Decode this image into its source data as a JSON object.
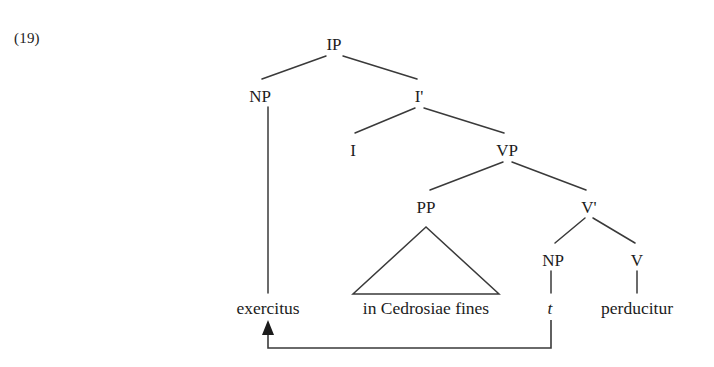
{
  "example": {
    "number": "(19)"
  },
  "tree": {
    "nodes": [
      {
        "id": "IP",
        "label": "IP",
        "x": 334,
        "y": 36
      },
      {
        "id": "NP1",
        "label": "NP",
        "x": 260,
        "y": 88
      },
      {
        "id": "Ibar",
        "label": "I'",
        "x": 419,
        "y": 88
      },
      {
        "id": "I",
        "label": "I",
        "x": 353,
        "y": 142
      },
      {
        "id": "VP",
        "label": "VP",
        "x": 507,
        "y": 142
      },
      {
        "id": "PP",
        "label": "PP",
        "x": 426,
        "y": 199
      },
      {
        "id": "Vbar",
        "label": "V'",
        "x": 589,
        "y": 199
      },
      {
        "id": "NP2",
        "label": "NP",
        "x": 553,
        "y": 252
      },
      {
        "id": "V",
        "label": "V",
        "x": 637,
        "y": 252
      }
    ],
    "leaves": [
      {
        "id": "leaf-exercitus",
        "text": "exercitus",
        "x": 268,
        "y": 300,
        "italic": false
      },
      {
        "id": "leaf-pp",
        "text": "in Cedrosiae fines",
        "x": 426,
        "y": 300,
        "italic": false
      },
      {
        "id": "leaf-trace",
        "text": "t",
        "x": 550,
        "y": 300,
        "italic": true
      },
      {
        "id": "leaf-perducitur",
        "text": "perducitur",
        "x": 637,
        "y": 300,
        "italic": false
      }
    ],
    "edges": [
      {
        "from": "IP",
        "to": "NP1"
      },
      {
        "from": "IP",
        "to": "Ibar"
      },
      {
        "from": "Ibar",
        "to": "I"
      },
      {
        "from": "Ibar",
        "to": "VP"
      },
      {
        "from": "VP",
        "to": "PP"
      },
      {
        "from": "VP",
        "to": "Vbar"
      },
      {
        "from": "Vbar",
        "to": "NP2"
      },
      {
        "from": "Vbar",
        "to": "V"
      },
      {
        "from": "NP1",
        "to": "leaf-exercitus"
      },
      {
        "from": "NP2",
        "to": "leaf-trace"
      },
      {
        "from": "V",
        "to": "leaf-perducitur"
      }
    ],
    "triangle": {
      "parent": "PP",
      "apex_x": 426,
      "apex_y": 227,
      "left_x": 353,
      "right_x": 499,
      "base_y": 294
    },
    "movement_arrow": {
      "from_x": 550,
      "from_y": 320,
      "bottom_y": 348,
      "to_x": 268,
      "to_y": 322,
      "description": "movement from trace position to subject position"
    }
  },
  "colors": {
    "ink": "#1c1c1c",
    "line": "#3a3a3a",
    "background": "#ffffff"
  }
}
